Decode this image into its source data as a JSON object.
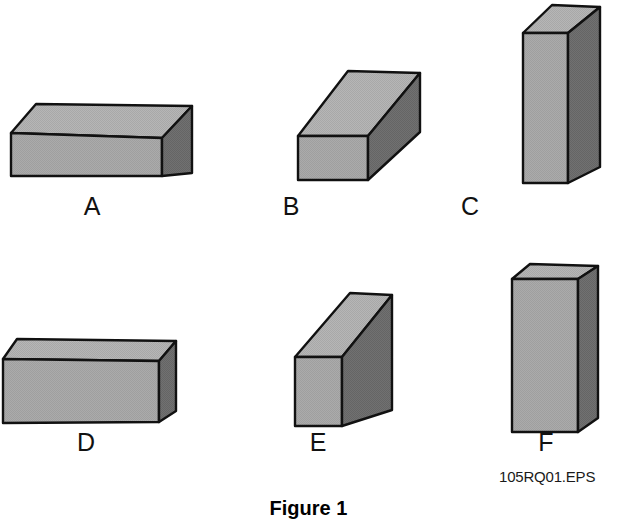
{
  "figure": {
    "caption": "Figure 1",
    "eps_code": "105RQ01.EPS",
    "background_color": "#ffffff",
    "stroke_color": "#111111",
    "top_face_color": "#b4b4b4",
    "front_face_color": "#a9a9a9",
    "side_face_color": "#6e6e6e"
  },
  "shapes": [
    {
      "label": "A",
      "description": "wide flat rectangular solid, shallow height",
      "label_x": 92,
      "label_y": 194,
      "geometry": {
        "front": "11,133 11,176 162,176 162,138 162,138",
        "front_poly": "11,133 162,138 162,176 11,176",
        "top_poly": "11,133 36,104 192,106 162,138",
        "side_poly": "162,138 192,106 192,173 162,176"
      }
    },
    {
      "label": "B",
      "description": "medium rectangular solid seen at an angle",
      "label_x": 291,
      "label_y": 194,
      "geometry": {
        "front_poly": "298,136 368,136 368,180 298,180",
        "top_poly": "298,136 348,71 420,73 368,136",
        "side_poly": "368,136 420,73 420,132 368,180"
      }
    },
    {
      "label": "C",
      "description": "tall narrow upright rectangular solid",
      "label_x": 470,
      "label_y": 194,
      "geometry": {
        "front_poly": "523,33 568,33 568,183 523,183",
        "top_poly": "523,33 552,5 600,7 568,33",
        "side_poly": "568,33 600,7 600,167 568,183"
      }
    },
    {
      "label": "D",
      "description": "long low rectangular solid",
      "label_x": 86,
      "label_y": 430,
      "geometry": {
        "front_poly": "3,359 159,361 159,422 3,423",
        "top_poly": "3,359 17,339 176,341 159,361",
        "side_poly": "159,361 176,341 176,411 159,422"
      }
    },
    {
      "label": "E",
      "description": "narrow upright rectangular solid at an angle",
      "label_x": 318,
      "label_y": 430,
      "geometry": {
        "front_poly": "295,357 342,357 342,426 295,426",
        "top_poly": "295,357 350,293 392,295 342,357",
        "side_poly": "342,357 392,295 392,410 342,426"
      }
    },
    {
      "label": "F",
      "description": "tall upright rectangular solid, wide face",
      "label_x": 546,
      "label_y": 430,
      "geometry": {
        "front_poly": "512,279 578,279 578,432 512,432",
        "top_poly": "512,279 530,264 598,266 578,279",
        "side_poly": "578,279 598,266 598,418 578,432"
      }
    }
  ]
}
